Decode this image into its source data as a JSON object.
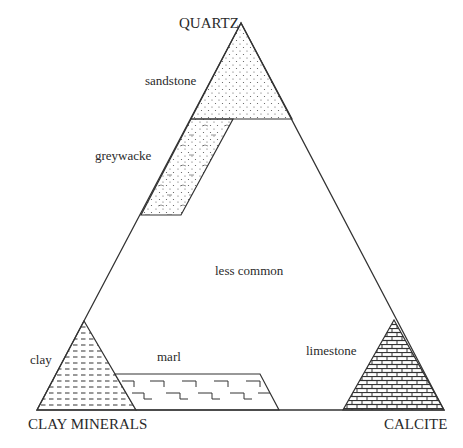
{
  "diagram": {
    "type": "ternary",
    "vertices": {
      "top": "QUARTZ",
      "bottom_left": "CLAY MINERALS",
      "bottom_right": "CALCITE"
    },
    "regions": [
      {
        "id": "sandstone",
        "label": "sandstone",
        "pattern": "dots"
      },
      {
        "id": "greywacke",
        "label": "greywacke",
        "pattern": "dots-with-dashes"
      },
      {
        "id": "less-common",
        "label": "less common",
        "pattern": "none"
      },
      {
        "id": "clay",
        "label": "clay",
        "pattern": "dashes"
      },
      {
        "id": "marl",
        "label": "marl",
        "pattern": "brick-outline"
      },
      {
        "id": "limestone",
        "label": "limestone",
        "pattern": "brick"
      }
    ],
    "colors": {
      "line": "#333333",
      "background": "#ffffff"
    }
  }
}
